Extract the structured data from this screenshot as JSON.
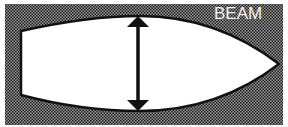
{
  "diagram": {
    "label": "BEAM",
    "measurement": "beam",
    "colors": {
      "background_pattern_dark": "#1a1a1a",
      "background_pattern_light": "#9a9a9a",
      "hull_fill": "#ffffff",
      "outline": "#111111",
      "label": "#f2f2f2"
    }
  }
}
